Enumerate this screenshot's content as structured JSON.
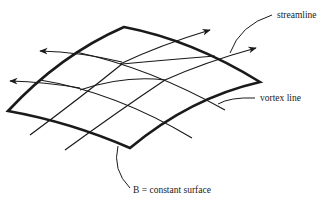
{
  "diagram": {
    "type": "surface-grid-illustration",
    "colors": {
      "ink": "#1a1a1a",
      "background": "#ffffff"
    },
    "labels": {
      "streamline": "streamline",
      "vortex_line": "vortex line",
      "surface": "B = constant surface"
    },
    "elements": [
      {
        "id": "surface",
        "kind": "curved quadrilateral patch (thick outline)"
      },
      {
        "id": "streamlines",
        "kind": "curves with arrowheads",
        "count": 4
      },
      {
        "id": "vortex-lines",
        "kind": "curves without arrowheads",
        "count": 4
      }
    ]
  }
}
